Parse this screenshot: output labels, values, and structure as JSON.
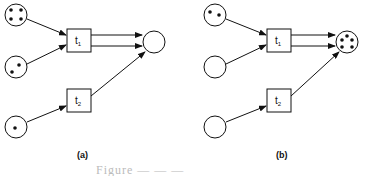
{
  "figure": {
    "caption_partial": "Figure — — —",
    "panels": [
      {
        "label": "(a)",
        "places": [
          {
            "id": "p1",
            "tokens": 4
          },
          {
            "id": "p2",
            "tokens": 2
          },
          {
            "id": "p3",
            "tokens": 1
          },
          {
            "id": "p4",
            "tokens": 0
          }
        ],
        "transitions": [
          {
            "id": "t1",
            "label": "t",
            "sub": "1"
          },
          {
            "id": "t2",
            "label": "t",
            "sub": "2"
          }
        ]
      },
      {
        "label": "(b)",
        "places": [
          {
            "id": "p1",
            "tokens": 2
          },
          {
            "id": "p2",
            "tokens": 0
          },
          {
            "id": "p3",
            "tokens": 0
          },
          {
            "id": "p4",
            "tokens": 5
          }
        ],
        "transitions": [
          {
            "id": "t1",
            "label": "t",
            "sub": "1"
          },
          {
            "id": "t2",
            "label": "t",
            "sub": "2"
          }
        ]
      }
    ],
    "arcs": [
      "p1->t1",
      "p2->t1",
      "t1->p4 (x2)",
      "p3->t2",
      "t2->p4"
    ]
  }
}
